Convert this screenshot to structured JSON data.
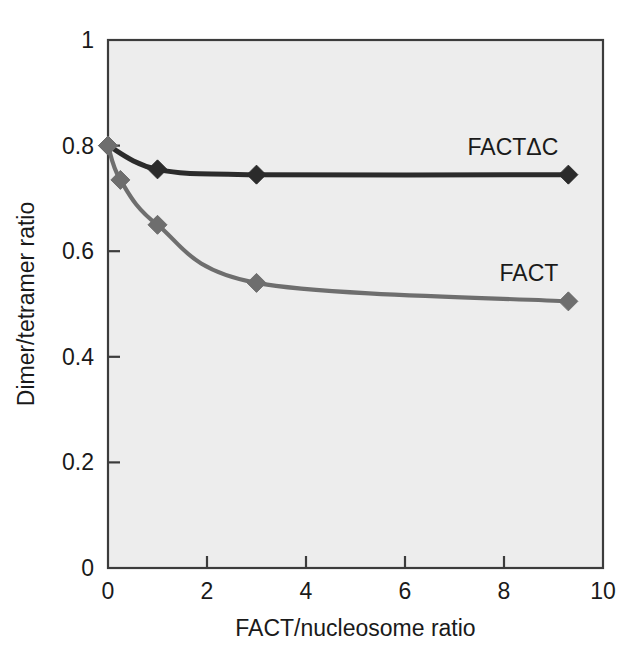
{
  "chart_data": {
    "type": "line",
    "title": "",
    "subtitle": "",
    "xlabel": "FACT/nucleosome ratio",
    "ylabel": "Dimer/tetramer ratio",
    "xlim": [
      0,
      10
    ],
    "ylim": [
      0,
      1
    ],
    "xticks": [
      0,
      2,
      4,
      6,
      8,
      10
    ],
    "xtick_labels": [
      "0",
      "2",
      "4",
      "6",
      "8",
      "10"
    ],
    "yticks": [
      0,
      0.2,
      0.4,
      0.6,
      0.8,
      1
    ],
    "ytick_labels": [
      "0",
      "0.2",
      "0.4",
      "0.6",
      "0.8",
      "1"
    ],
    "grid": false,
    "legend_position": "inline-right-of-curve",
    "plot_background": "#ededed",
    "frame_color": "#3c3c3c",
    "marker": "diamond",
    "series": [
      {
        "name": "FACTΔC",
        "color": "#2b2b2b",
        "label": "FACTΔC",
        "x": [
          0,
          1,
          3,
          9.3
        ],
        "y": [
          0.8,
          0.755,
          0.745,
          0.745
        ]
      },
      {
        "name": "FACT",
        "color": "#6e6e6e",
        "label": "FACT",
        "x": [
          0,
          0.25,
          1,
          3,
          9.3
        ],
        "y": [
          0.8,
          0.735,
          0.65,
          0.54,
          0.505
        ]
      }
    ]
  },
  "figure": {
    "page_background": "#ffffff"
  }
}
